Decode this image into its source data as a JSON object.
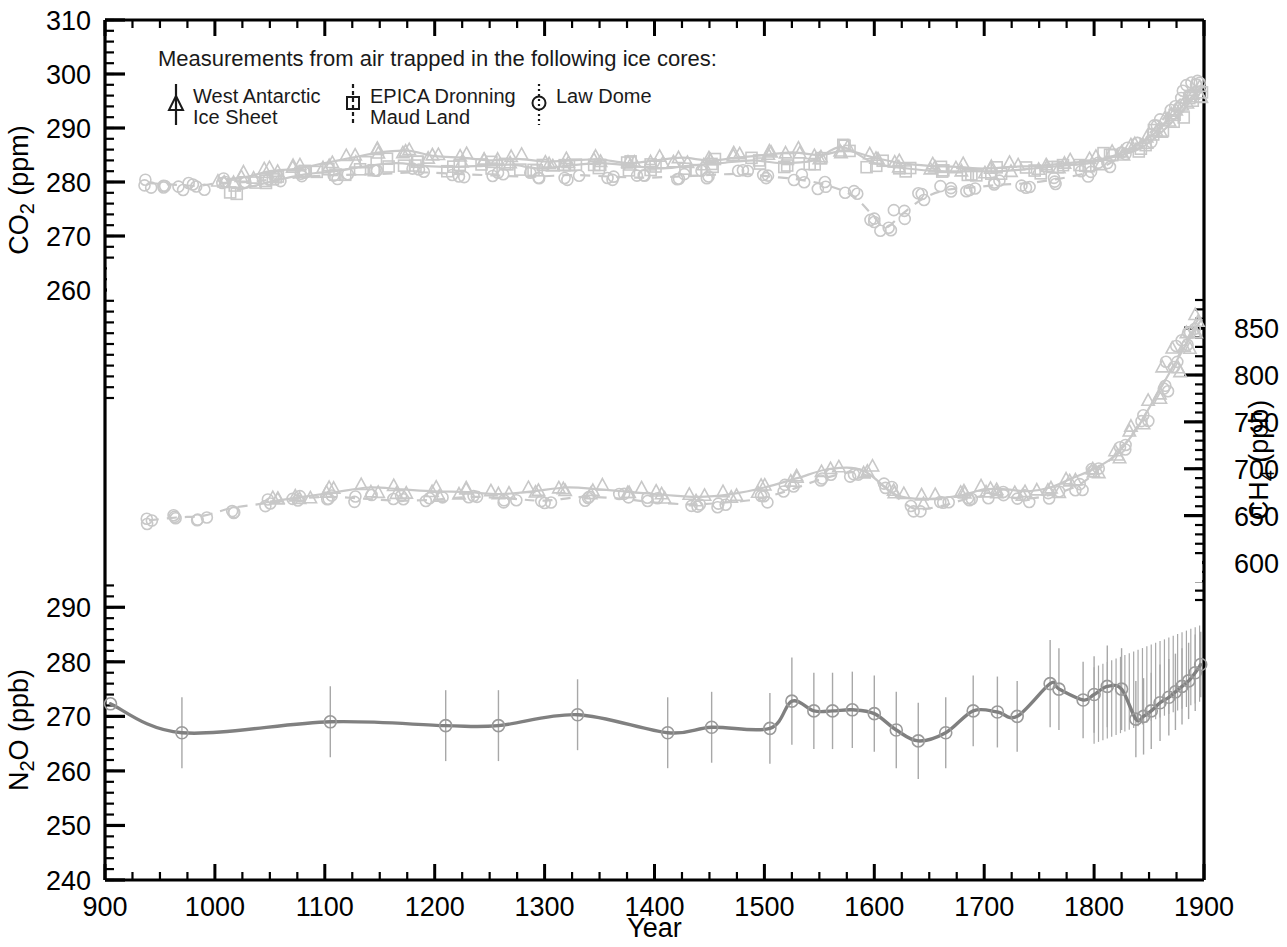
{
  "figure": {
    "xlabel": "Year",
    "axes": [
      {
        "id": "co2",
        "label": "CO2 (ppm)",
        "label_html": "CO₂ (ppm)",
        "side": "left",
        "ymin": 240,
        "ymax": 310,
        "ticks": [
          260,
          270,
          280,
          290,
          300,
          310
        ],
        "minor_step": 2
      },
      {
        "id": "ch4",
        "label": "CH4 (ppb)",
        "label_html": "CH₄ (ppb)",
        "side": "right",
        "ymin": 560,
        "ymax": 880,
        "ticks": [
          600,
          650,
          700,
          750,
          800,
          850
        ],
        "minor_step": 10
      },
      {
        "id": "n2o",
        "label": "N2O (ppb)",
        "label_html": "N₂O (ppb)",
        "side": "left",
        "ymin": 240,
        "ymax": 295,
        "ticks": [
          240,
          250,
          260,
          270,
          280,
          290
        ],
        "minor_step": 2
      }
    ],
    "xticks": [
      900,
      1000,
      1100,
      1200,
      1300,
      1400,
      1500,
      1600,
      1700,
      1800,
      1900
    ],
    "xminor_step": 25
  },
  "legend": {
    "heading": "Measurements from air trapped in the following ice cores:",
    "entries": [
      {
        "name": "West Antarctic Ice Sheet",
        "line1": "West Antarctic",
        "line2": "Ice Sheet",
        "marker": "triangle",
        "errorbar": "solid",
        "icon": "triangle-marker-icon"
      },
      {
        "name": "EPICA Dronning Maud Land",
        "line1": "EPICA Dronning",
        "line2": "Maud Land",
        "marker": "square",
        "errorbar": "dashed",
        "icon": "square-marker-icon"
      },
      {
        "name": "Law Dome",
        "line1": "Law Dome",
        "line2": "",
        "marker": "circle",
        "errorbar": "dotted",
        "icon": "circle-marker-icon"
      }
    ]
  },
  "colors": {
    "axis": "#000000",
    "co2_series": "#c8c8c8",
    "ch4_series": "#c8c8c8",
    "n2o_series": "#808080",
    "n2o_errorbar": "#a8a8a8"
  },
  "chart_data": {
    "type": "line",
    "title": "",
    "xlabel": "Year",
    "xlim": [
      900,
      1900
    ],
    "grid": false,
    "legend_position": "top-left",
    "panels": [
      {
        "id": "co2",
        "ylabel": "CO2 (ppm)",
        "ylim": [
          240,
          310
        ],
        "yticks": [
          260,
          270,
          280,
          290,
          300,
          310
        ],
        "note": "Upper band; three ice-core records overlaid with smoothing splines",
        "series": [
          {
            "name": "West Antarctic Ice Sheet",
            "marker": "triangle",
            "x": [
              1010,
              1030,
              1050,
              1075,
              1100,
              1125,
              1150,
              1175,
              1200,
              1225,
              1250,
              1275,
              1300,
              1325,
              1350,
              1375,
              1400,
              1425,
              1450,
              1475,
              1500,
              1525,
              1550,
              1575,
              1600,
              1625,
              1650,
              1675,
              1700,
              1725,
              1750,
              1775,
              1800,
              1820,
              1840,
              1855,
              1870,
              1880,
              1890,
              1898
            ],
            "y": [
              280.5,
              281.0,
              282.0,
              282.5,
              283.5,
              284.5,
              285.5,
              285.8,
              284.8,
              284.5,
              284.0,
              284.3,
              283.8,
              284.0,
              284.2,
              283.5,
              284.0,
              284.5,
              284.0,
              284.5,
              285.0,
              285.5,
              285.0,
              285.8,
              284.5,
              283.5,
              283.0,
              282.8,
              282.5,
              282.8,
              283.0,
              283.5,
              284.0,
              285.0,
              287.0,
              289.0,
              292.0,
              294.0,
              296.0,
              297.5
            ]
          },
          {
            "name": "EPICA Dronning Maud Land",
            "marker": "square",
            "x": [
              1020,
              1040,
              1060,
              1085,
              1110,
              1140,
              1165,
              1190,
              1215,
              1245,
              1270,
              1295,
              1320,
              1350,
              1380,
              1405,
              1430,
              1460,
              1490,
              1515,
              1545,
              1570,
              1600,
              1630,
              1660,
              1690,
              1715,
              1745,
              1770,
              1795,
              1815,
              1840,
              1860,
              1875,
              1888,
              1896
            ],
            "y": [
              278.5,
              279.5,
              280.5,
              281.5,
              282.0,
              283.0,
              283.5,
              283.0,
              282.8,
              283.0,
              283.2,
              282.5,
              283.0,
              283.5,
              283.0,
              282.5,
              283.0,
              283.5,
              284.0,
              283.5,
              284.0,
              286.5,
              283.5,
              282.5,
              282.0,
              282.0,
              282.0,
              282.5,
              283.0,
              283.5,
              284.5,
              286.0,
              289.0,
              292.0,
              295.0,
              297.0
            ]
          },
          {
            "name": "Law Dome",
            "marker": "circle",
            "x": [
              940,
              955,
              970,
              985,
              1005,
              1030,
              1055,
              1085,
              1115,
              1150,
              1185,
              1220,
              1255,
              1290,
              1325,
              1360,
              1390,
              1420,
              1450,
              1480,
              1505,
              1530,
              1555,
              1580,
              1600,
              1610,
              1625,
              1645,
              1665,
              1690,
              1715,
              1740,
              1765,
              1790,
              1810,
              1830,
              1845,
              1860,
              1872,
              1882,
              1890,
              1896
            ],
            "y": [
              279.8,
              279.6,
              279.4,
              279.3,
              279.8,
              280.0,
              280.5,
              281.0,
              281.3,
              281.5,
              281.8,
              281.5,
              281.2,
              281.0,
              281.3,
              281.0,
              280.8,
              281.0,
              281.3,
              281.5,
              281.0,
              280.5,
              279.5,
              277.5,
              273.5,
              271.5,
              274.0,
              277.0,
              278.5,
              279.0,
              279.5,
              279.8,
              280.5,
              281.5,
              283.0,
              285.5,
              288.0,
              291.0,
              294.0,
              296.0,
              297.5,
              298.5
            ]
          }
        ]
      },
      {
        "id": "ch4",
        "ylabel": "CH4 (ppb)",
        "ylim": [
          560,
          880
        ],
        "yticks": [
          600,
          650,
          700,
          750,
          800,
          850
        ],
        "note": "Middle band; WAIS and Law Dome records",
        "series": [
          {
            "name": "West Antarctic Ice Sheet",
            "marker": "triangle",
            "x": [
              1050,
              1080,
              1110,
              1140,
              1170,
              1200,
              1230,
              1260,
              1290,
              1320,
              1350,
              1380,
              1410,
              1440,
              1470,
              1500,
              1530,
              1560,
              1590,
              1620,
              1650,
              1680,
              1700,
              1720,
              1740,
              1760,
              1780,
              1800,
              1820,
              1840,
              1855,
              1870,
              1880,
              1890,
              1898
            ],
            "y": [
              665,
              670,
              675,
              680,
              678,
              676,
              675,
              673,
              676,
              680,
              678,
              675,
              672,
              670,
              673,
              680,
              690,
              700,
              698,
              672,
              668,
              672,
              678,
              678,
              676,
              680,
              690,
              700,
              715,
              745,
              775,
              805,
              825,
              845,
              860
            ]
          },
          {
            "name": "Law Dome",
            "marker": "circle",
            "x": [
              940,
              965,
              990,
              1015,
              1045,
              1075,
              1105,
              1135,
              1165,
              1200,
              1235,
              1270,
              1300,
              1335,
              1370,
              1400,
              1435,
              1465,
              1495,
              1525,
              1555,
              1585,
              1610,
              1635,
              1660,
              1685,
              1710,
              1735,
              1760,
              1785,
              1805,
              1825,
              1845,
              1860,
              1872,
              1882,
              1890,
              1896
            ],
            "y": [
              645,
              648,
              650,
              658,
              663,
              668,
              670,
              668,
              666,
              667,
              670,
              668,
              666,
              670,
              668,
              664,
              662,
              664,
              668,
              678,
              690,
              696,
              680,
              658,
              660,
              668,
              672,
              668,
              672,
              682,
              700,
              722,
              755,
              785,
              810,
              832,
              850,
              862
            ]
          }
        ]
      },
      {
        "id": "n2o",
        "ylabel": "N2O (ppb)",
        "ylim": [
          240,
          295
        ],
        "yticks": [
          240,
          250,
          260,
          270,
          280,
          290
        ],
        "note": "Lower band; single smoothed record with vertical error bars",
        "series": [
          {
            "name": "Law Dome",
            "marker": "circle",
            "x": [
              905,
              970,
              1105,
              1210,
              1258,
              1330,
              1412,
              1452,
              1505,
              1525,
              1545,
              1562,
              1580,
              1600,
              1620,
              1640,
              1665,
              1690,
              1712,
              1730,
              1760,
              1768,
              1790,
              1800,
              1812,
              1825,
              1838,
              1845,
              1852,
              1860,
              1868,
              1874,
              1880,
              1886,
              1892,
              1897
            ],
            "y": [
              272.3,
              267.0,
              269.0,
              268.3,
              268.3,
              270.3,
              267.0,
              268.0,
              267.8,
              272.8,
              271.0,
              271.0,
              271.2,
              270.5,
              267.5,
              265.5,
              267.0,
              271.0,
              270.8,
              270.0,
              276.0,
              275.0,
              273.0,
              274.0,
              275.5,
              275.0,
              269.5,
              270.0,
              271.0,
              272.5,
              273.5,
              274.5,
              275.5,
              276.5,
              278.0,
              279.5
            ],
            "yerr": [
              0,
              6.5,
              6.5,
              6.5,
              6.5,
              6.5,
              6.5,
              6.5,
              6.5,
              8.0,
              7.0,
              7.0,
              7.0,
              7.0,
              7.0,
              7.0,
              6.5,
              6.5,
              6.5,
              6.5,
              8.0,
              7.5,
              7.0,
              7.0,
              7.5,
              7.5,
              7.0,
              7.0,
              7.0,
              7.0,
              7.0,
              7.0,
              7.0,
              7.0,
              7.0,
              6.0
            ]
          }
        ]
      }
    ]
  }
}
